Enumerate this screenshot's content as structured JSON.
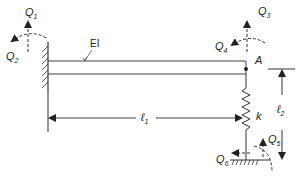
{
  "diagram": {
    "type": "structural-frame-dof",
    "labels": {
      "q1": {
        "main": "Q",
        "sub": "1"
      },
      "q2": {
        "main": "Q",
        "sub": "2"
      },
      "q3": {
        "main": "Q",
        "sub": "3"
      },
      "q4": {
        "main": "Q",
        "sub": "4"
      },
      "q5": {
        "main": "Q",
        "sub": "5"
      },
      "q6": {
        "main": "Q",
        "sub": "6"
      },
      "ei": "EI",
      "node_a": "A",
      "l1": {
        "main": "ℓ",
        "sub": "1"
      },
      "l2": {
        "main": "ℓ",
        "sub": "2"
      },
      "spring": "k"
    },
    "colors": {
      "line": "#333333",
      "background": "#ffffff"
    }
  }
}
